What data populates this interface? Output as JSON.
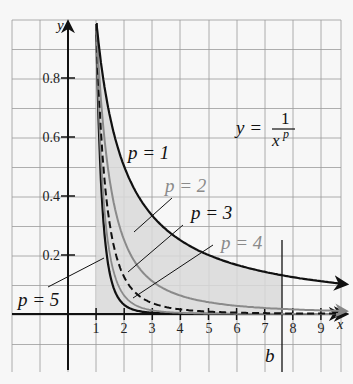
{
  "chart_data": {
    "type": "line",
    "title": "",
    "formula": "y = 1/x^p",
    "xlabel": "x",
    "ylabel": "y",
    "xlim": [
      -2,
      10
    ],
    "ylim": [
      -0.2,
      0.95
    ],
    "grid": true,
    "x_ticks": [
      1,
      2,
      3,
      4,
      5,
      6,
      7,
      8,
      9
    ],
    "y_ticks": [
      0.2,
      0.4,
      0.6,
      0.8
    ],
    "x_tick_labels": [
      "1",
      "2",
      "3",
      "4",
      "5",
      "6",
      "7",
      "8",
      "9"
    ],
    "y_tick_labels": [
      "0.2",
      "0.4",
      "0.6",
      "0.8"
    ],
    "series": [
      {
        "name": "p = 1",
        "p": 1,
        "style": "solid",
        "color": "#111111"
      },
      {
        "name": "p = 2",
        "p": 2,
        "style": "solid",
        "color": "#888888"
      },
      {
        "name": "p = 3",
        "p": 3,
        "style": "dashed",
        "color": "#111111"
      },
      {
        "name": "p = 4",
        "p": 4,
        "style": "solid",
        "color": "#888888"
      },
      {
        "name": "p = 5",
        "p": 5,
        "style": "solid",
        "color": "#111111"
      }
    ],
    "annotations": [
      {
        "text": "b",
        "x": 7.6,
        "type": "vertical-line"
      },
      {
        "text": "shaded area under y=1/x from x=1 to x=b"
      }
    ]
  },
  "labels": {
    "y_axis": "y",
    "x_axis": "x",
    "formula_lhs": "y =",
    "formula_num": "1",
    "formula_den": "x",
    "formula_exp": "p",
    "b": "b",
    "p1": "p = 1",
    "p2": "p = 2",
    "p3": "p = 3",
    "p4": "p = 4",
    "p5": "p = 5",
    "xt1": "1",
    "xt2": "2",
    "xt3": "3",
    "xt4": "4",
    "xt5": "5",
    "xt6": "6",
    "xt7": "7",
    "xt8": "8",
    "xt9": "9",
    "yt02": "0.2",
    "yt04": "0.4",
    "yt06": "0.6",
    "yt08": "0.8"
  }
}
